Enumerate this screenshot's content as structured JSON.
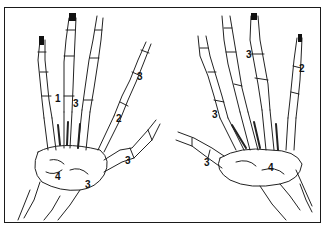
{
  "figure": {
    "frame_color": "#1a1a1a",
    "ink_color": "#222222",
    "left_hand": {
      "labels": [
        {
          "text": "1",
          "x": 55,
          "y": 94
        },
        {
          "text": "3",
          "x": 73,
          "y": 99
        },
        {
          "text": "2",
          "x": 116,
          "y": 114
        },
        {
          "text": "3",
          "x": 137,
          "y": 72
        },
        {
          "text": "3",
          "x": 125,
          "y": 156
        },
        {
          "text": "4",
          "x": 55,
          "y": 172
        },
        {
          "text": "3",
          "x": 85,
          "y": 180
        }
      ]
    },
    "right_hand": {
      "labels": [
        {
          "text": "3",
          "x": 246,
          "y": 50
        },
        {
          "text": "2",
          "x": 299,
          "y": 64
        },
        {
          "text": "3",
          "x": 212,
          "y": 110
        },
        {
          "text": "3",
          "x": 204,
          "y": 158
        },
        {
          "text": "4",
          "x": 268,
          "y": 163
        }
      ]
    }
  }
}
